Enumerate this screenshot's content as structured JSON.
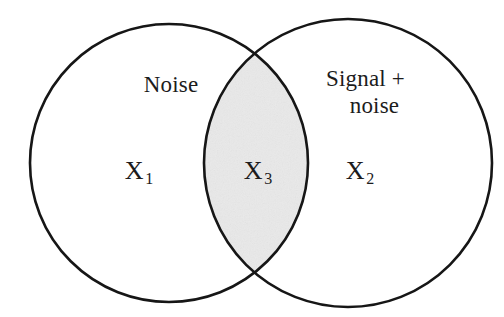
{
  "figure": {
    "type": "venn-diagram",
    "background_color": "#ffffff",
    "stroke_color": "#161616",
    "stroke_width": 2.6,
    "intersection_fill": "#e9e9e9",
    "text_color": "#1c1c1c"
  },
  "sets": {
    "left": {
      "name": "Noise",
      "variable": "X",
      "variable_subscript": "1",
      "center_x": 169,
      "center_y": 163,
      "radius": 139
    },
    "right": {
      "name_line_1": "Signal +",
      "name_line_2": "noise",
      "variable": "X",
      "variable_subscript": "2",
      "center_x": 348,
      "center_y": 163,
      "radius": 144
    },
    "intersection": {
      "variable": "X",
      "variable_subscript": "3",
      "shaded": true,
      "top_crossing_y": 58,
      "bottom_crossing_y": 268
    }
  }
}
